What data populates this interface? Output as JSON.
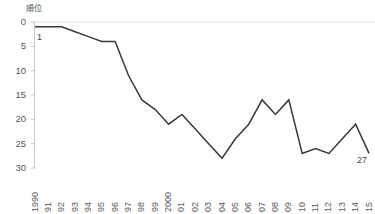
{
  "chart_data": {
    "type": "line",
    "title": "",
    "subtitle": "",
    "xlabel": "",
    "ylabel": "順位",
    "ylim": [
      0,
      30
    ],
    "y_inverted": true,
    "grid": false,
    "legend": "none",
    "line_color": "#3a3a3a",
    "axis_color": "#c9c9c9",
    "gridline_color": "#e4e4e4",
    "categories": [
      "1990",
      "91",
      "92",
      "93",
      "94",
      "95",
      "96",
      "97",
      "98",
      "99",
      "2000",
      "01",
      "02",
      "03",
      "04",
      "05",
      "06",
      "07",
      "08",
      "09",
      "10",
      "11",
      "12",
      "13",
      "14",
      "15"
    ],
    "x": [
      1990,
      1991,
      1992,
      1993,
      1994,
      1995,
      1996,
      1997,
      1998,
      1999,
      2000,
      2001,
      2002,
      2003,
      2004,
      2005,
      2006,
      2007,
      2008,
      2009,
      2010,
      2011,
      2012,
      2013,
      2014,
      2015
    ],
    "values": [
      1,
      1,
      1,
      2,
      3,
      4,
      4,
      11,
      16,
      18,
      21,
      19,
      22,
      25,
      28,
      24,
      21,
      16,
      19,
      16,
      27,
      26,
      27,
      24,
      21,
      27
    ],
    "y_ticks": [
      0,
      5,
      10,
      15,
      20,
      25,
      30
    ],
    "y_tick_labels": [
      "0",
      "5",
      "10",
      "15",
      "20",
      "25",
      "30"
    ],
    "annotations": [
      {
        "text": "1",
        "x_index": 0,
        "value": 1,
        "position": "below-right"
      },
      {
        "text": "27",
        "x_index": 25,
        "value": 27,
        "position": "below-left"
      }
    ]
  },
  "axis": {
    "y_unit_label": "順位"
  }
}
